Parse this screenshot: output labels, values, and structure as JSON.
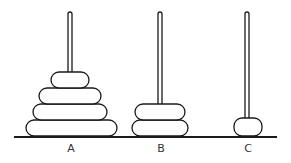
{
  "pegs": [
    {
      "label": "A",
      "x": 70,
      "disc_count": 4
    },
    {
      "label": "B",
      "x": 160,
      "disc_count": 2
    },
    {
      "label": "C",
      "x": 248,
      "disc_count": 1
    }
  ],
  "colors": {
    "stroke": "#1a1a1a",
    "fill": "#ffffff"
  }
}
